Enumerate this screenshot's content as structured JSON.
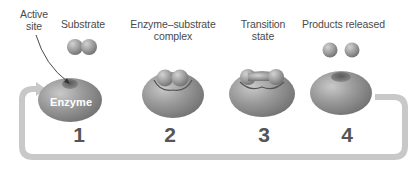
{
  "diagram": {
    "labels": {
      "active_site": "Active\nsite",
      "active_site_line1": "Active",
      "active_site_line2": "site",
      "substrate": "Substrate",
      "complex_line1": "Enzyme–substrate",
      "complex_line2": "complex",
      "transition_line1": "Transition",
      "transition_line2": "state",
      "products": "Products released",
      "enzyme": "Enzyme"
    },
    "steps": [
      {
        "number": "1",
        "stage": "Enzyme with empty active site; substrate approaching"
      },
      {
        "number": "2",
        "stage": "Enzyme–substrate complex"
      },
      {
        "number": "3",
        "stage": "Transition state"
      },
      {
        "number": "4",
        "stage": "Products released"
      }
    ],
    "cycle_arrow": "Return arrow from step 4 back to step 1",
    "colors": {
      "enzyme_fill": "#8f8f8f",
      "enzyme_highlight": "#c4c4c4",
      "substrate_fill": "#9a9a9a",
      "arrow": "#c8c8c8",
      "text": "#4a4a4a",
      "number": "#555555"
    }
  }
}
